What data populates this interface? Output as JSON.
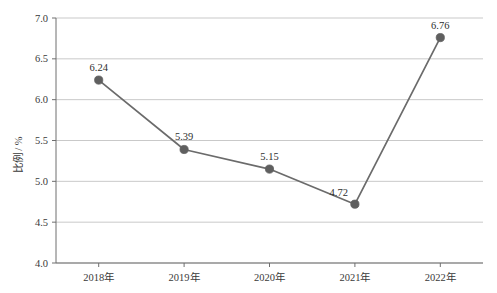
{
  "chart_data": {
    "type": "line",
    "title": "",
    "subtitle": "",
    "xlabel": "",
    "ylabel": "比例 / %",
    "categories": [
      "2018年",
      "2019年",
      "2020年",
      "2021年",
      "2022年"
    ],
    "values": [
      6.24,
      5.39,
      5.15,
      4.72,
      6.76
    ],
    "point_labels": [
      "6.24",
      "5.39",
      "5.15",
      "4.72",
      "6.76"
    ],
    "series": [
      {
        "name": "比例",
        "values": [
          6.24,
          5.39,
          5.15,
          4.72,
          6.76
        ]
      }
    ],
    "ylim": [
      4.0,
      7.0
    ],
    "ytick_values": [
      7.0,
      6.5,
      6.0,
      5.5,
      5.0,
      4.5,
      4.0
    ],
    "ytick_labels": [
      "7.0",
      "6.5",
      "6.0",
      "5.5",
      "5.0",
      "4.5",
      "4.0"
    ],
    "grid": true,
    "grid_axis": "y",
    "legend": false,
    "legend_position": "none",
    "marker": "circle",
    "colors": {
      "line": "#6b6b6b",
      "marker": "#5f5f5f",
      "grid": "#c9c9c9",
      "axis": "#6e6e6e",
      "text": "#3a3a3a",
      "background": "#ffffff"
    }
  }
}
